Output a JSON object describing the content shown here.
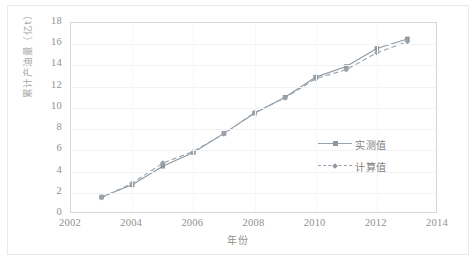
{
  "chart_data": {
    "type": "line",
    "title": "",
    "xlabel": "年份",
    "ylabel": "累计产油量（亿t）",
    "xlim": [
      2002,
      2014
    ],
    "ylim": [
      0,
      18
    ],
    "xticks": [
      "2002",
      "2004",
      "2006",
      "2008",
      "2010",
      "2012",
      "2014"
    ],
    "yticks": [
      "0",
      "2",
      "4",
      "6",
      "8",
      "10",
      "12",
      "14",
      "16",
      "18"
    ],
    "grid": true,
    "legend_position": "center-right",
    "x": [
      2003,
      2004,
      2005,
      2006,
      2007,
      2008,
      2009,
      2010,
      2011,
      2012,
      2013
    ],
    "series": [
      {
        "name": "实测值",
        "style": "solid",
        "marker": "square",
        "color": "#8e98a1",
        "values": [
          1.6,
          2.75,
          4.5,
          5.8,
          7.6,
          9.5,
          11.0,
          12.9,
          13.9,
          15.6,
          16.5
        ]
      },
      {
        "name": "计算值",
        "style": "dashed",
        "marker": "diamond",
        "color": "#9aa3ab",
        "values": [
          1.55,
          2.9,
          4.8,
          5.9,
          7.55,
          9.55,
          10.95,
          12.75,
          13.6,
          15.2,
          16.25
        ]
      }
    ]
  },
  "axes": {
    "x_title": "年份",
    "y_title": "累计产油量（亿t）",
    "x_tick_labels": [
      "2002",
      "2004",
      "2006",
      "2008",
      "2010",
      "2012",
      "2014"
    ],
    "y_tick_labels": [
      "18",
      "16",
      "14",
      "12",
      "10",
      "8",
      "6",
      "4",
      "2",
      "0"
    ]
  },
  "legend": {
    "items": [
      {
        "label": "实测值",
        "style": "solid",
        "marker": "square"
      },
      {
        "label": "计算值",
        "style": "dashed",
        "marker": "diamond"
      }
    ]
  },
  "colors": {
    "series_measured": "#8e98a1",
    "series_calculated": "#9aa3ab",
    "grid": "#f2f2f2",
    "axis_text": "#909090",
    "plot_border": "#d7d7d7",
    "outer_frame": "#e9e9e9",
    "background": "#ffffff"
  }
}
